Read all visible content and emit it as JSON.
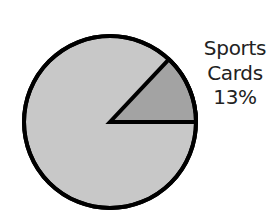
{
  "chart_data": {
    "type": "pie",
    "title": "",
    "slices": [
      {
        "label": "Sports Cards",
        "value": 13,
        "color": "#a3a3a3",
        "labeled": true
      },
      {
        "label": "",
        "value": 87,
        "color": "#c8c8c8",
        "labeled": false
      }
    ],
    "legend": "none",
    "annotations": [
      {
        "text": "Sports Cards 13%",
        "position": "right of pie, beside highlighted slice"
      }
    ],
    "outline_color": "#000000"
  },
  "labels": {
    "slice_name_line1": "Sports",
    "slice_name_line2": "Cards",
    "slice_percent": "13%"
  },
  "colors": {
    "highlight_slice": "#a3a3a3",
    "rest_of_pie": "#c8c8c8",
    "outline": "#000000",
    "label_text": "#222222"
  }
}
